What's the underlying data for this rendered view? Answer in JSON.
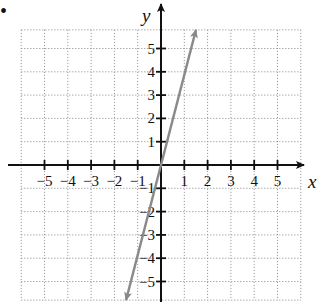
{
  "problem_marker": "•",
  "chart_data": {
    "type": "line",
    "title": "",
    "xlabel": "x",
    "ylabel": "y",
    "xlim": [
      -6,
      6
    ],
    "ylim": [
      -5.8,
      5.8
    ],
    "grid": true,
    "grid_style": "dotted",
    "x_ticks": [
      -5,
      -4,
      -3,
      -2,
      -1,
      1,
      2,
      3,
      4,
      5
    ],
    "y_ticks": [
      -5,
      -4,
      -3,
      -2,
      -1,
      1,
      2,
      3,
      4,
      5
    ],
    "x_tick_labels": [
      "−5",
      "−4",
      "−3",
      "−2",
      "−1",
      "1",
      "2",
      "3",
      "4",
      "5"
    ],
    "y_tick_labels": [
      "−5",
      "−4",
      "−3",
      "−2",
      "−1",
      "1",
      "2",
      "3",
      "4",
      "5"
    ],
    "series": [
      {
        "name": "line",
        "equation_estimate": "y = 4x",
        "color": "#8a8a8a",
        "arrows_both_ends": true,
        "points": [
          [
            -1.5,
            -5.8
          ],
          [
            0,
            0
          ],
          [
            1.5,
            5.8
          ]
        ]
      }
    ],
    "legend": null
  },
  "colors": {
    "axis": "#111111",
    "grid": "#9a9a9a",
    "line": "#8a8a8a"
  }
}
